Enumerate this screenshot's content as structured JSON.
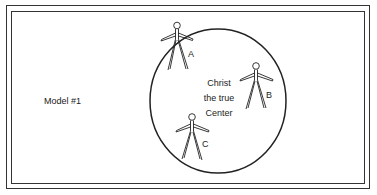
{
  "diagram": {
    "model_label": "Model #1",
    "center_label": {
      "line1": "Christ",
      "line2": "the true",
      "line3": "Center"
    },
    "figures": [
      {
        "id": "A",
        "label": "A",
        "position": "on circle edge, top-left"
      },
      {
        "id": "B",
        "label": "B",
        "position": "inside circle, right"
      },
      {
        "id": "C",
        "label": "C",
        "position": "inside circle, lower-left, near edge"
      }
    ],
    "colors": {
      "line": "#222222",
      "background": "#ffffff"
    }
  }
}
